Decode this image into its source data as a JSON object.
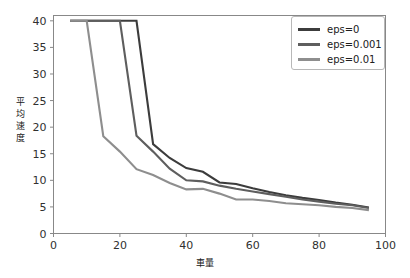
{
  "chart_data": {
    "type": "line",
    "title": "",
    "xlabel": "車量",
    "ylabel": "平均速度",
    "xlim": [
      0,
      100
    ],
    "ylim": [
      0,
      41
    ],
    "xticks": [
      0,
      20,
      40,
      60,
      80,
      100
    ],
    "yticks": [
      0,
      5,
      10,
      15,
      20,
      25,
      30,
      35,
      40
    ],
    "grid": false,
    "legend_position": "upper right",
    "series": [
      {
        "name": "eps=0",
        "color": "#3c3c3c",
        "x": [
          5,
          10,
          15,
          20,
          25,
          30,
          35,
          40,
          45,
          50,
          55,
          60,
          65,
          70,
          75,
          80,
          85,
          90,
          95
        ],
        "y": [
          40,
          40,
          40,
          40,
          40,
          16.8,
          14.2,
          12.3,
          11.6,
          9.6,
          9.3,
          8.5,
          7.8,
          7.2,
          6.7,
          6.3,
          5.8,
          5.4,
          4.9
        ]
      },
      {
        "name": "eps=0.001",
        "color": "#5e5e5e",
        "x": [
          5,
          10,
          15,
          20,
          25,
          30,
          35,
          40,
          45,
          50,
          55,
          60,
          65,
          70,
          75,
          80,
          85,
          90,
          95
        ],
        "y": [
          40,
          40,
          40,
          40,
          18.4,
          15.4,
          12.2,
          10.0,
          9.8,
          9.0,
          8.4,
          7.9,
          7.4,
          6.9,
          6.4,
          6.0,
          5.6,
          5.3,
          4.8
        ]
      },
      {
        "name": "eps=0.01",
        "color": "#8e8e8e",
        "x": [
          5,
          10,
          15,
          20,
          25,
          30,
          35,
          40,
          45,
          50,
          55,
          60,
          65,
          70,
          75,
          80,
          85,
          90,
          95
        ],
        "y": [
          40,
          40,
          18.3,
          15.4,
          12.1,
          11.0,
          9.5,
          8.3,
          8.4,
          7.5,
          6.4,
          6.4,
          6.1,
          5.7,
          5.5,
          5.3,
          5.0,
          4.8,
          4.4
        ]
      }
    ]
  },
  "legend": {
    "items": [
      {
        "label": "eps=0",
        "color": "#3c3c3c"
      },
      {
        "label": "eps=0.001",
        "color": "#5e5e5e"
      },
      {
        "label": "eps=0.01",
        "color": "#8e8e8e"
      }
    ]
  },
  "axes": {
    "x_tick_labels": [
      "0",
      "20",
      "40",
      "60",
      "80",
      "100"
    ],
    "y_tick_labels": [
      "0",
      "5",
      "10",
      "15",
      "20",
      "25",
      "30",
      "35",
      "40"
    ],
    "x_title": "車量",
    "y_title": "平均速度",
    "y_title_chars": [
      "平",
      "均",
      "速",
      "度"
    ]
  }
}
